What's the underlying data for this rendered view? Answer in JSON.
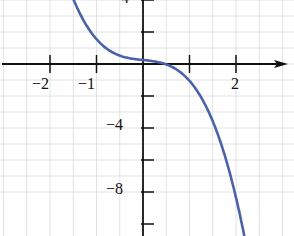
{
  "chart_data": {
    "type": "line",
    "title": "",
    "xlabel": "",
    "ylabel": "",
    "xlim": [
      -2.5,
      2.8
    ],
    "ylim": [
      -11,
      4
    ],
    "grid": true,
    "x_tick_labels": [
      "-2",
      "-1",
      "2"
    ],
    "y_tick_labels": [
      "4",
      "-4",
      "-8"
    ],
    "x_ticks": [
      -2,
      -1,
      1,
      2
    ],
    "y_ticks": [
      4,
      2,
      -2,
      -4,
      -6,
      -8,
      -10
    ],
    "series": [
      {
        "name": "curve",
        "color": "#4a63a8",
        "x": [
          -1.6,
          -1.2,
          -0.8,
          -0.4,
          0,
          0.35,
          0.8,
          1.2,
          1.6,
          2.0,
          2.3
        ],
        "y": [
          4.3,
          2.3,
          1.0,
          0.45,
          0.25,
          0.0,
          -0.5,
          -1.8,
          -4.3,
          -8.4,
          -12.0
        ]
      }
    ]
  },
  "labels": {
    "x_m2": "−2",
    "x_m1": "−1",
    "x_2": "2",
    "y_4": "4",
    "y_m4": "−4",
    "y_m8": "−8"
  }
}
